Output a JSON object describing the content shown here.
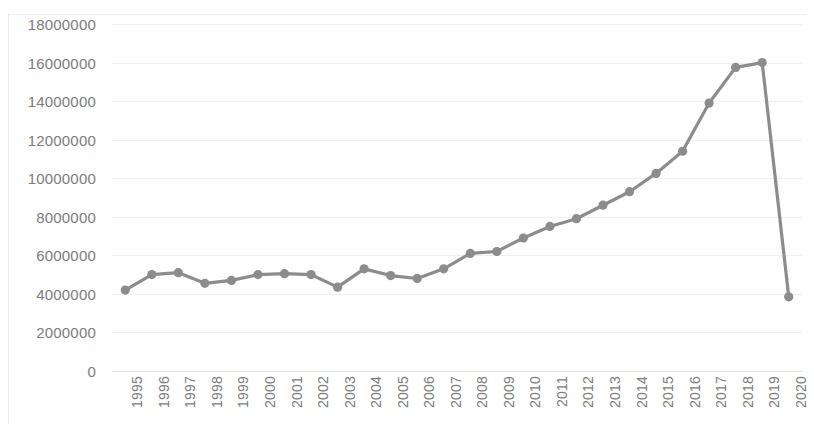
{
  "chart_data": {
    "type": "line",
    "title": "",
    "subtitle": "",
    "xlabel": "",
    "ylabel": "",
    "categories": [
      "1995",
      "1996",
      "1997",
      "1998",
      "1999",
      "2000",
      "2001",
      "2002",
      "2003",
      "2004",
      "2005",
      "2006",
      "2007",
      "2008",
      "2009",
      "2010",
      "2011",
      "2012",
      "2013",
      "2014",
      "2015",
      "2016",
      "2017",
      "2018",
      "2019",
      "2020"
    ],
    "values": [
      4200000,
      5000000,
      5100000,
      4550000,
      4700000,
      5000000,
      5050000,
      5000000,
      4350000,
      5300000,
      4950000,
      4800000,
      5300000,
      6100000,
      6200000,
      6900000,
      7500000,
      7900000,
      8600000,
      9300000,
      10250000,
      11400000,
      13900000,
      15750000,
      16000000,
      3850000
    ],
    "series": [
      {
        "name": "",
        "values": [
          4200000,
          5000000,
          5100000,
          4550000,
          4700000,
          5000000,
          5050000,
          5000000,
          4350000,
          5300000,
          4950000,
          4800000,
          5300000,
          6100000,
          6200000,
          6900000,
          7500000,
          7900000,
          8600000,
          9300000,
          10250000,
          11400000,
          13900000,
          15750000,
          16000000,
          3850000
        ],
        "color": "#8c8c8c",
        "marker": "circle"
      }
    ],
    "ylim": [
      0,
      18000000
    ],
    "y_ticks": [
      0,
      2000000,
      4000000,
      6000000,
      8000000,
      10000000,
      12000000,
      14000000,
      16000000,
      18000000
    ],
    "y_tick_labels": [
      "0",
      "2000000",
      "4000000",
      "6000000",
      "8000000",
      "10000000",
      "12000000",
      "14000000",
      "16000000",
      "18000000"
    ],
    "x_tick_labels": [
      "1995",
      "1996",
      "1997",
      "1998",
      "1999",
      "2000",
      "2001",
      "2002",
      "2003",
      "2004",
      "2005",
      "2006",
      "2007",
      "2008",
      "2009",
      "2010",
      "2011",
      "2012",
      "2013",
      "2014",
      "2015",
      "2016",
      "2017",
      "2018",
      "2019",
      "2020"
    ],
    "x_tick_rotation": -90,
    "grid": true,
    "grid_axis": "y",
    "legend": false,
    "legend_position": "none",
    "annotations": []
  },
  "style": {
    "line_color": "#8c8c8c",
    "marker_color": "#8c8c8c",
    "grid_color": "#f0f0f0",
    "axis_color": "#e3e3e3",
    "tick_label_color": "#7c7c7c",
    "background": "#fefefe"
  }
}
